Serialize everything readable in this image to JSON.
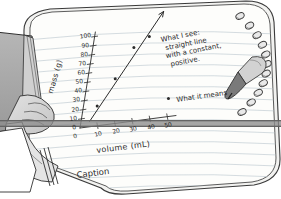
{
  "scene": {
    "title": "Hand holding spiral notebook with hand-drawn graph",
    "paper_color": "#fdfdfb",
    "ink_color": "#2b2b2b",
    "rule_line_color": "#b9c3cc",
    "skin_fill": "#d8d8d8",
    "sleeve_fill": "#a9a9a9",
    "band_color": "#8f8f8f",
    "pencil_body": "#cfcfcf",
    "pencil_tip": "#6a6a6a",
    "spiral_ring_color": "#555555"
  },
  "notebook": {
    "spiral_rings_count": 11,
    "caption_label": "Caption"
  },
  "annotations": {
    "what_i_see": {
      "line1": "What I see:",
      "line2": "straight line",
      "line3": "with a constant,",
      "line4": "positive."
    },
    "what_it_means": "What it means"
  },
  "chart_data": {
    "type": "scatter",
    "title": "",
    "xlabel": "volume (mL)",
    "ylabel": "mass (g)",
    "xlim": [
      0,
      55
    ],
    "ylim": [
      0,
      105
    ],
    "grid": false,
    "legend": "none",
    "xticks": [
      0,
      10,
      20,
      30,
      40,
      50
    ],
    "xtick_labels": [
      "0",
      "10",
      "20",
      "30",
      "40",
      "50"
    ],
    "yticks": [
      0,
      10,
      20,
      30,
      40,
      50,
      60,
      70,
      80,
      90,
      100
    ],
    "ytick_labels": [
      "0",
      "10",
      "20",
      "30",
      "40",
      "50",
      "60",
      "70",
      "80",
      "90",
      "100"
    ],
    "origin_label": "0",
    "points": [
      {
        "x": 8,
        "y": 22
      },
      {
        "x": 16,
        "y": 50
      },
      {
        "x": 24,
        "y": 82
      },
      {
        "x": 32,
        "y": 92
      },
      {
        "x": 49,
        "y": 20
      }
    ],
    "trendline": {
      "kind": "line-of-best-fit",
      "arrow": true,
      "x_start": 5,
      "y_start": 6,
      "x_end": 38,
      "y_end": 118,
      "note": "constant positive slope"
    }
  }
}
